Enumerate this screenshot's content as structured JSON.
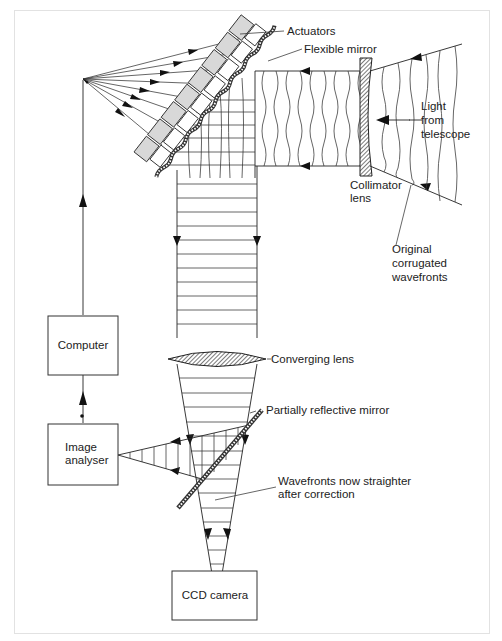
{
  "diagram": {
    "colors": {
      "line": "#222222",
      "actuator_fill": "#d8d8d8",
      "frame": "#e2e2e2",
      "hatch": "#333333"
    },
    "labels": {
      "actuators": "Actuators",
      "flexible_mirror": "Flexible mirror",
      "light_from_telescope": [
        "Light",
        "from",
        "telescope"
      ],
      "collimator_lens": [
        "Collimator",
        "lens"
      ],
      "original_wavefronts": [
        "Original",
        "corrugated",
        "wavefronts"
      ],
      "converging_lens": "Converging lens",
      "partially_reflective_mirror": "Partially reflective mirror",
      "wavefronts_straighter": [
        "Wavefronts now straighter",
        "after correction"
      ]
    },
    "boxes": {
      "computer": "Computer",
      "image_analyser": [
        "Image",
        "analyser"
      ],
      "ccd_camera": "CCD camera"
    }
  }
}
